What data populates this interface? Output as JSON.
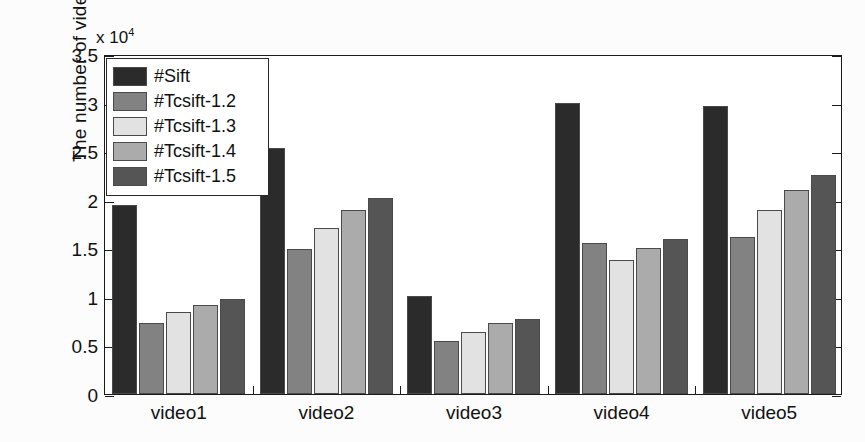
{
  "chart_data": {
    "type": "bar",
    "title": "",
    "subtitle": "",
    "xlabel": "",
    "ylabel": "The number of video features",
    "y_multiplier": "x 10",
    "y_multiplier_exponent": "4",
    "categories": [
      "video1",
      "video2",
      "video3",
      "video4",
      "video5"
    ],
    "ylim": [
      0,
      35000
    ],
    "yticks": [
      0,
      5000,
      10000,
      15000,
      20000,
      25000,
      30000,
      35000
    ],
    "ytick_labels": [
      "0",
      "0.5",
      "1",
      "1.5",
      "2",
      "2.5",
      "3",
      "3.5"
    ],
    "grid": false,
    "legend_position": "top-left",
    "series": [
      {
        "name": "#Sift",
        "color": "#2b2b2b",
        "values": [
          19500,
          25300,
          10100,
          30000,
          29700
        ]
      },
      {
        "name": "#Tcsift-1.2",
        "color": "#828282",
        "values": [
          7300,
          14900,
          5500,
          15500,
          16200
        ]
      },
      {
        "name": "#Tcsift-1.3",
        "color": "#e2e2e2",
        "values": [
          8400,
          17100,
          6400,
          13800,
          18900
        ]
      },
      {
        "name": "#Tcsift-1.4",
        "color": "#ababab",
        "values": [
          9200,
          18900,
          7300,
          15000,
          21000
        ]
      },
      {
        "name": "#Tcsift-1.5",
        "color": "#555555",
        "values": [
          9800,
          20200,
          7700,
          16000,
          22500
        ]
      }
    ]
  },
  "legend": {
    "items": [
      {
        "label": "#Sift"
      },
      {
        "label": "#Tcsift-1.2"
      },
      {
        "label": "#Tcsift-1.3"
      },
      {
        "label": "#Tcsift-1.4"
      },
      {
        "label": "#Tcsift-1.5"
      }
    ]
  }
}
